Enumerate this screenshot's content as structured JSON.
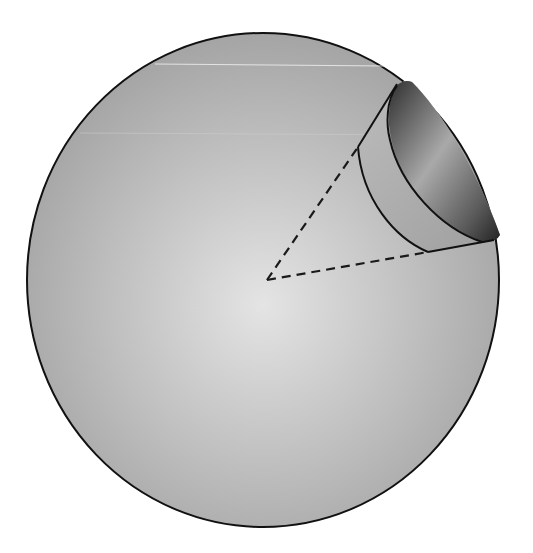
{
  "figure": {
    "colors": {
      "background": "#ffffff",
      "sphere_light": "#e6e6e6",
      "sphere_mid": "#b4b4b4",
      "sphere_dark": "#9a9a9a",
      "outline": "#111111",
      "cavity_dark": "#3a3a3a",
      "cavity_light": "#a8a8a8"
    },
    "sphere": {
      "cx": 263,
      "cy": 280,
      "rx": 236,
      "ry": 247
    },
    "cone": {
      "apex": [
        267,
        280
      ],
      "upper_edge_end": [
        358,
        147
      ],
      "lower_edge_end": [
        427,
        252
      ]
    }
  }
}
